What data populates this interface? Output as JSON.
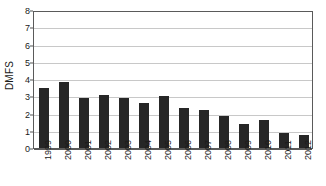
{
  "chart_data": {
    "type": "bar",
    "title": "",
    "xlabel": "",
    "ylabel": "DMFS",
    "categories": [
      "1999",
      "2000",
      "2001",
      "2002",
      "2003",
      "2004",
      "2005",
      "2006",
      "2007",
      "2008",
      "2009",
      "2010",
      "2011",
      "2012"
    ],
    "values": [
      3.5,
      3.8,
      2.9,
      3.1,
      2.9,
      2.6,
      3.0,
      2.3,
      2.2,
      1.85,
      1.4,
      1.6,
      0.88,
      0.78
    ],
    "series": [
      {
        "name": "DMFS",
        "values": [
          3.5,
          3.8,
          2.9,
          3.1,
          2.9,
          2.6,
          3.0,
          2.3,
          2.2,
          1.85,
          1.4,
          1.6,
          0.88,
          0.78
        ]
      }
    ],
    "ylim": [
      0,
      8
    ],
    "yticks": [
      0,
      1,
      2,
      3,
      4,
      5,
      6,
      7,
      8
    ],
    "ytick_labels": [
      "0",
      "1",
      "2",
      "3",
      "4",
      "5",
      "6",
      "7",
      "8"
    ],
    "grid": true,
    "grid_axis": "y",
    "legend": false,
    "legend_position": "none",
    "bar_color": "#262626",
    "gridline_color": "#c8c8c8",
    "axis_color": "#5a5a5a",
    "background_color": "#ffffff"
  }
}
